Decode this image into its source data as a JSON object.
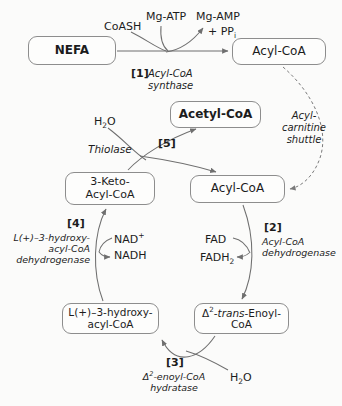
{
  "diagram": {
    "background_color": "#fbfbfa",
    "line_color": "#6f6f6f",
    "box_border_color": "#8d8d8d",
    "nodes": [
      {
        "id": "nefa",
        "label": "NEFA",
        "bold": true
      },
      {
        "id": "acylcoa_top",
        "label": "Acyl-CoA",
        "bold": false
      },
      {
        "id": "acetylcoa",
        "label": "Acetyl-CoA",
        "bold": true
      },
      {
        "id": "ketoacyl",
        "label": "3-Keto-\nAcyl-CoA",
        "bold": false
      },
      {
        "id": "acylcoa_cyc",
        "label": "Acyl-CoA",
        "bold": false
      },
      {
        "id": "hydroxy",
        "label": "L(+)–3-hydroxy-\nacyl-CoA",
        "bold": false
      },
      {
        "id": "enoyl",
        "label": "Δ2-trans-Enoyl-\nCoA",
        "bold": false
      }
    ],
    "substrates": {
      "coash": "CoASH",
      "mg_atp": "Mg-ATP",
      "mg_amp": "Mg-AMP",
      "ppi": "+ PPi",
      "h2o_top": "H2O",
      "nad_plus": "NAD+",
      "nadh": "NADH",
      "fad": "FAD",
      "fadh2": "FADH2",
      "h2o_bottom": "H2O"
    },
    "steps": [
      {
        "number": "[1]",
        "enzyme": "Acyl-CoA\nsynthase"
      },
      {
        "number": "[2]",
        "enzyme": "Acyl-CoA\ndehydrogenase"
      },
      {
        "number": "[3]",
        "enzyme": "Δ2-enoyl-CoA\nhydratase"
      },
      {
        "number": "[4]",
        "enzyme": "L(+)–3-hydroxy-\nacyl-CoA\ndehydrogenase"
      },
      {
        "number": "[5]",
        "enzyme": "Thiolase"
      }
    ],
    "annotations": {
      "shuttle": "Acyl-\ncarnitine\nshuttle"
    }
  }
}
